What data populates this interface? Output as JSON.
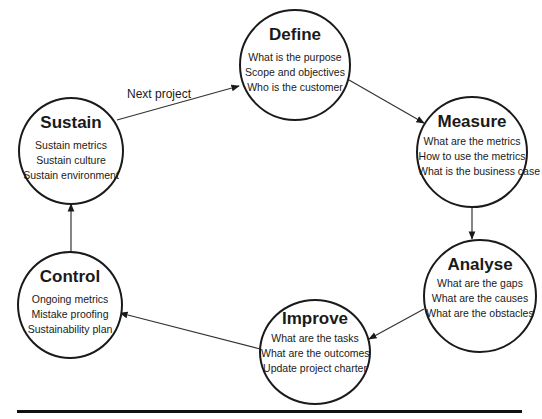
{
  "diagram": {
    "type": "cycle",
    "nodes": [
      {
        "id": "define",
        "title": "Define",
        "items": [
          "What is the purpose",
          "Scope and objectives",
          "Who is the customer"
        ]
      },
      {
        "id": "measure",
        "title": "Measure",
        "items": [
          "What are the metrics",
          "How to use the metrics",
          "What is the business case"
        ]
      },
      {
        "id": "analyse",
        "title": "Analyse",
        "items": [
          "What are the gaps",
          "What are the causes",
          "What are the obstacles"
        ]
      },
      {
        "id": "improve",
        "title": "Improve",
        "items": [
          "What are the tasks",
          "What are the outcomes",
          "Update project charter"
        ]
      },
      {
        "id": "control",
        "title": "Control",
        "items": [
          "Ongoing metrics",
          "Mistake proofing",
          "Sustainability plan"
        ]
      },
      {
        "id": "sustain",
        "title": "Sustain",
        "items": [
          "Sustain metrics",
          "Sustain culture",
          "Sustain environment"
        ]
      }
    ],
    "edges": [
      {
        "from": "define",
        "to": "measure",
        "label": ""
      },
      {
        "from": "measure",
        "to": "analyse",
        "label": ""
      },
      {
        "from": "analyse",
        "to": "improve",
        "label": ""
      },
      {
        "from": "improve",
        "to": "control",
        "label": ""
      },
      {
        "from": "control",
        "to": "sustain",
        "label": ""
      },
      {
        "from": "sustain",
        "to": "define",
        "label": "Next project"
      }
    ]
  }
}
